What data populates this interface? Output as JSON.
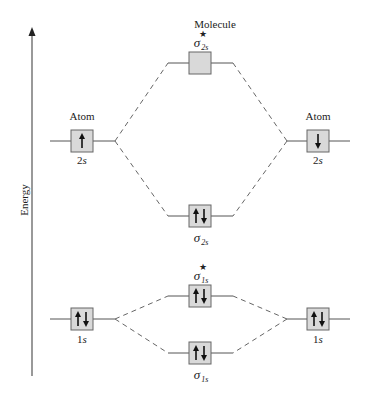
{
  "axis": {
    "label": "Energy"
  },
  "headers": {
    "molecule": "Molecule",
    "atom_left": "Atom",
    "atom_right": "Atom"
  },
  "orbitals": {
    "left_2s": {
      "label_num": "2",
      "label_sub": "s",
      "electrons": "↑"
    },
    "right_2s": {
      "label_num": "2",
      "label_sub": "s",
      "electrons": "↓"
    },
    "sigma_star_2s": {
      "symbol": "σ",
      "sub": "2s",
      "star": "★",
      "electrons": ""
    },
    "sigma_2s": {
      "symbol": "σ",
      "sub": "2s",
      "electrons": "↑↓"
    },
    "left_1s": {
      "label_num": "1",
      "label_sub": "s",
      "electrons": "↑↓"
    },
    "right_1s": {
      "label_num": "1",
      "label_sub": "s",
      "electrons": "↑↓"
    },
    "sigma_star_1s": {
      "symbol": "σ",
      "sub": "1s",
      "star": "★",
      "electrons": "↑↓"
    },
    "sigma_1s": {
      "symbol": "σ",
      "sub": "1s",
      "electrons": "↑↓"
    }
  },
  "colors": {
    "box_fill": "#d9d9d9",
    "line": "#555555",
    "arrow": "#111111"
  }
}
